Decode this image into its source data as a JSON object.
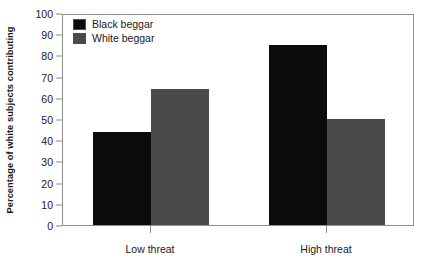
{
  "chart_data": {
    "type": "bar",
    "title": "",
    "xlabel": "",
    "ylabel": "Percentage of white subjects contributing",
    "categories": [
      "Low threat",
      "High threat"
    ],
    "series": [
      {
        "name": "Black beggar",
        "values": [
          44,
          85
        ],
        "color": "#0b0b0b"
      },
      {
        "name": "White beggar",
        "values": [
          64,
          50
        ],
        "color": "#4a4a4a"
      }
    ],
    "ylim": [
      0,
      100
    ],
    "y_ticks": [
      0,
      10,
      20,
      30,
      40,
      50,
      60,
      70,
      80,
      90,
      100
    ],
    "y_tick_labels": [
      "0",
      "10",
      "20",
      "30",
      "40",
      "50",
      "60",
      "70",
      "80",
      "90",
      "100"
    ],
    "grid": false,
    "legend_position": "top-left-inside",
    "frame_color": "#8f8f8f",
    "background": "#ffffff"
  },
  "legend": {
    "entries": [
      {
        "label": "Black beggar",
        "color": "#0b0b0b"
      },
      {
        "label": "White beggar",
        "color": "#4a4a4a"
      }
    ]
  }
}
